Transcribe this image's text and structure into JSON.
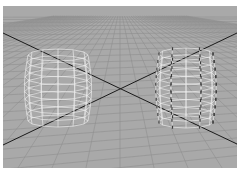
{
  "viewport": {
    "label": "3D perspective viewport",
    "background_color": "#a9a9a9",
    "grid_color": "#8e8e8e",
    "axis_color": "#1a1a1a",
    "wireframe_color": "#f4f4f4",
    "vertex_marker_color": "#3a3a3a"
  },
  "objects": [
    {
      "name": "barrel-left",
      "selected_vertices": false
    },
    {
      "name": "barrel-right",
      "selected_vertices": true
    }
  ]
}
